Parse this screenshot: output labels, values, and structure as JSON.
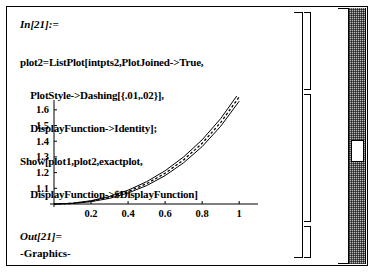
{
  "window": {
    "title": "Mathematica Notebook"
  },
  "input_cell": {
    "prompt": "In[21]:=",
    "code_lines": [
      "plot2=ListPlot[intpts2,PlotJoined->True,",
      "    PlotStyle->Dashing[{.01,.02}],",
      "    DisplayFunction->Identity];",
      "Show[plot1,plot2,exactplot,",
      "    DisplayFunction->$DisplayFunction]"
    ]
  },
  "output_cell": {
    "prompt": "Out[21]=",
    "text": "-Graphics-"
  },
  "chart_data": {
    "type": "line",
    "title": "",
    "xlabel": "",
    "ylabel": "",
    "xlim": [
      0,
      1.08
    ],
    "ylim": [
      1.0,
      1.65
    ],
    "xticks": [
      "0.2",
      "0.4",
      "0.6",
      "0.8",
      "1"
    ],
    "xtick_values": [
      0.2,
      0.4,
      0.6,
      0.8,
      1.0
    ],
    "yticks": [
      "1.1",
      "1.2",
      "1.3",
      "1.4",
      "1.5",
      "1.6"
    ],
    "ytick_values": [
      1.1,
      1.2,
      1.3,
      1.4,
      1.5,
      1.6
    ],
    "grid": false,
    "legend": "none",
    "series": [
      {
        "name": "exactplot",
        "style": "solid",
        "x": [
          0,
          0.1,
          0.2,
          0.3,
          0.4,
          0.5,
          0.6,
          0.7,
          0.8,
          0.9,
          1.0
        ],
        "values": [
          1.0,
          1.005,
          1.021,
          1.048,
          1.088,
          1.142,
          1.212,
          1.3,
          1.409,
          1.544,
          1.71
        ]
      },
      {
        "name": "plot2",
        "style": "dashed",
        "x": [
          0,
          0.1,
          0.2,
          0.3,
          0.4,
          0.5,
          0.6,
          0.7,
          0.8,
          0.9,
          1.0
        ],
        "values": [
          1.0,
          1.004,
          1.018,
          1.042,
          1.079,
          1.129,
          1.196,
          1.281,
          1.387,
          1.519,
          1.682
        ]
      },
      {
        "name": "plot1",
        "style": "solid",
        "x": [
          0,
          0.1,
          0.2,
          0.3,
          0.4,
          0.5,
          0.6,
          0.7,
          0.8,
          0.9,
          1.0
        ],
        "values": [
          1.0,
          1.003,
          1.015,
          1.036,
          1.07,
          1.117,
          1.181,
          1.263,
          1.366,
          1.495,
          1.655
        ]
      }
    ]
  },
  "brackets": {
    "group_bracket": "input-output-group",
    "input_bracket": "input-cell-bracket",
    "graphic_bracket": "graphic-cell-bracket",
    "output_bracket": "output-cell-bracket"
  },
  "scrollbar": {
    "orientation": "vertical",
    "thumb_label": "scroll-thumb"
  },
  "colors": {
    "text": "#000000",
    "background": "#ffffff",
    "scrollbar_track": "#b9b9b9",
    "thumb": "#ffffff"
  }
}
